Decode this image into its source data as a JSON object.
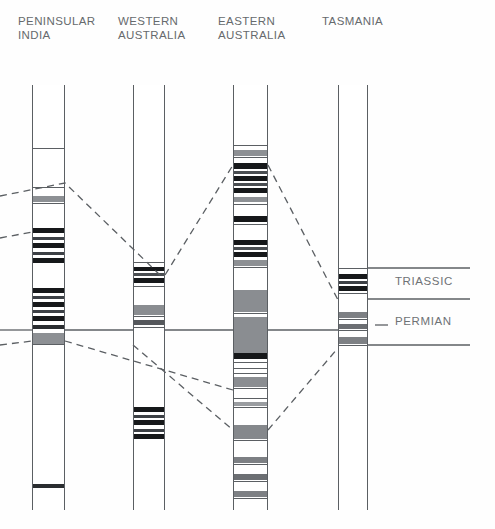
{
  "figure": {
    "type": "stratigraphic-correlation-chart",
    "width": 495,
    "height": 529,
    "background": "#fefefe"
  },
  "columns": [
    {
      "id": "peninsular-india",
      "title": "PENINSULAR\nINDIA",
      "title_x": 18,
      "title_y": 14,
      "x": 32,
      "width": 33,
      "top": 85,
      "bottom": 510,
      "bands": [
        {
          "y": 148,
          "h": 1.4,
          "color": "#5b5f63"
        },
        {
          "y": 187,
          "h": 1.4,
          "color": "#5b5f63"
        },
        {
          "y": 196,
          "h": 6,
          "color": "#8d9094"
        },
        {
          "y": 203,
          "h": 1.4,
          "color": "#5b5f63"
        },
        {
          "y": 228,
          "h": 5,
          "color": "#16181a"
        },
        {
          "y": 237,
          "h": 2.5,
          "color": "#3c4045"
        },
        {
          "y": 243,
          "h": 5,
          "color": "#16181a"
        },
        {
          "y": 252,
          "h": 2.5,
          "color": "#3c4045"
        },
        {
          "y": 258,
          "h": 5,
          "color": "#16181a"
        },
        {
          "y": 288,
          "h": 5,
          "color": "#16181a"
        },
        {
          "y": 296,
          "h": 3,
          "color": "#3c4045"
        },
        {
          "y": 302,
          "h": 5,
          "color": "#16181a"
        },
        {
          "y": 310,
          "h": 3,
          "color": "#3c4045"
        },
        {
          "y": 316,
          "h": 5,
          "color": "#16181a"
        },
        {
          "y": 325,
          "h": 4,
          "color": "#2a2d30"
        },
        {
          "y": 333,
          "h": 11,
          "color": "#8d9094"
        },
        {
          "y": 344,
          "h": 1.4,
          "color": "#5b5f63"
        },
        {
          "y": 484,
          "h": 4,
          "color": "#2a2d30"
        }
      ]
    },
    {
      "id": "western-australia",
      "title": "WESTERN\nAUSTRALIA",
      "title_x": 118,
      "title_y": 14,
      "x": 133,
      "width": 32,
      "top": 85,
      "bottom": 510,
      "bands": [
        {
          "y": 262,
          "h": 1.4,
          "color": "#5b5f63"
        },
        {
          "y": 267,
          "h": 4,
          "color": "#16181a"
        },
        {
          "y": 273,
          "h": 3,
          "color": "#4a4e52"
        },
        {
          "y": 278,
          "h": 5,
          "color": "#16181a"
        },
        {
          "y": 286,
          "h": 1.4,
          "color": "#5b5f63"
        },
        {
          "y": 305,
          "h": 10,
          "color": "#8a8d91"
        },
        {
          "y": 316,
          "h": 1.4,
          "color": "#5b5f63"
        },
        {
          "y": 320,
          "h": 5,
          "color": "#55585c"
        },
        {
          "y": 327,
          "h": 1.4,
          "color": "#5b5f63"
        },
        {
          "y": 407,
          "h": 5,
          "color": "#16181a"
        },
        {
          "y": 415,
          "h": 2.5,
          "color": "#3c4045"
        },
        {
          "y": 420,
          "h": 5,
          "color": "#16181a"
        },
        {
          "y": 429,
          "h": 2.5,
          "color": "#3c4045"
        },
        {
          "y": 434,
          "h": 5,
          "color": "#16181a"
        }
      ]
    },
    {
      "id": "eastern-australia",
      "title": "EASTERN\nAUSTRALIA",
      "title_x": 218,
      "title_y": 14,
      "x": 233,
      "width": 35,
      "top": 85,
      "bottom": 510,
      "bands": [
        {
          "y": 145,
          "h": 1.4,
          "color": "#5b5f63"
        },
        {
          "y": 150,
          "h": 6,
          "color": "#8d9094"
        },
        {
          "y": 157,
          "h": 1.4,
          "color": "#5b5f63"
        },
        {
          "y": 163,
          "h": 6,
          "color": "#16181a"
        },
        {
          "y": 171,
          "h": 3,
          "color": "#4a4e52"
        },
        {
          "y": 176,
          "h": 5,
          "color": "#16181a"
        },
        {
          "y": 183,
          "h": 3,
          "color": "#4a4e52"
        },
        {
          "y": 188,
          "h": 5,
          "color": "#16181a"
        },
        {
          "y": 197,
          "h": 5,
          "color": "#8d9094"
        },
        {
          "y": 204,
          "h": 1.4,
          "color": "#5b5f63"
        },
        {
          "y": 216,
          "h": 6,
          "color": "#16181a"
        },
        {
          "y": 224,
          "h": 1.4,
          "color": "#5b5f63"
        },
        {
          "y": 240,
          "h": 5,
          "color": "#16181a"
        },
        {
          "y": 247,
          "h": 3,
          "color": "#4a4e52"
        },
        {
          "y": 252,
          "h": 5,
          "color": "#16181a"
        },
        {
          "y": 260,
          "h": 6,
          "color": "#8d9094"
        },
        {
          "y": 267,
          "h": 1.4,
          "color": "#5b5f63"
        },
        {
          "y": 290,
          "h": 22,
          "color": "#8a8d91"
        },
        {
          "y": 313,
          "h": 1.4,
          "color": "#5b5f63"
        },
        {
          "y": 317,
          "h": 36,
          "color": "#8a8d91"
        },
        {
          "y": 353,
          "h": 6,
          "color": "#16181a"
        },
        {
          "y": 362,
          "h": 1.4,
          "color": "#5b5f63"
        },
        {
          "y": 368,
          "h": 1.4,
          "color": "#5b5f63"
        },
        {
          "y": 373,
          "h": 1.4,
          "color": "#5b5f63"
        },
        {
          "y": 377,
          "h": 10,
          "color": "#8a8d91"
        },
        {
          "y": 388,
          "h": 1.4,
          "color": "#5b5f63"
        },
        {
          "y": 398,
          "h": 1.4,
          "color": "#5b5f63"
        },
        {
          "y": 402,
          "h": 4,
          "color": "#9a9da1"
        },
        {
          "y": 407,
          "h": 1.4,
          "color": "#5b5f63"
        },
        {
          "y": 425,
          "h": 14,
          "color": "#85888c"
        },
        {
          "y": 440,
          "h": 1.4,
          "color": "#5b5f63"
        },
        {
          "y": 457,
          "h": 6,
          "color": "#7d8084"
        },
        {
          "y": 464,
          "h": 1.4,
          "color": "#5b5f63"
        },
        {
          "y": 474,
          "h": 6,
          "color": "#6c6f73"
        },
        {
          "y": 481,
          "h": 1.4,
          "color": "#5b5f63"
        },
        {
          "y": 491,
          "h": 6,
          "color": "#7d8084"
        },
        {
          "y": 498,
          "h": 1.4,
          "color": "#5b5f63"
        }
      ]
    },
    {
      "id": "tasmania",
      "title": "TASMANIA",
      "title_x": 322,
      "title_y": 14,
      "x": 338,
      "width": 30,
      "top": 85,
      "bottom": 510,
      "bands": [
        {
          "y": 268,
          "h": 1.4,
          "color": "#5b5f63"
        },
        {
          "y": 274,
          "h": 5,
          "color": "#16181a"
        },
        {
          "y": 281,
          "h": 2.5,
          "color": "#3c4045"
        },
        {
          "y": 286,
          "h": 5,
          "color": "#16181a"
        },
        {
          "y": 293,
          "h": 1.4,
          "color": "#5b5f63"
        },
        {
          "y": 312,
          "h": 6,
          "color": "#7d8084"
        },
        {
          "y": 319,
          "h": 1.4,
          "color": "#5b5f63"
        },
        {
          "y": 324,
          "h": 5,
          "color": "#6c6f73"
        },
        {
          "y": 330,
          "h": 1.4,
          "color": "#5b5f63"
        },
        {
          "y": 337,
          "h": 7,
          "color": "#7d8084"
        },
        {
          "y": 345,
          "h": 1.4,
          "color": "#5b5f63"
        }
      ]
    }
  ],
  "era_labels": [
    {
      "text": "TRIASSIC",
      "x": 395,
      "y": 275
    },
    {
      "text": "PERMIAN",
      "x": 395,
      "y": 315
    }
  ],
  "boundary_lines": [
    {
      "name": "triassic-top",
      "x1": 368,
      "y1": 268,
      "x2": 470,
      "y2": 268
    },
    {
      "name": "triassic-base",
      "x1": 368,
      "y1": 299,
      "x2": 470,
      "y2": 299
    },
    {
      "name": "permian-tick",
      "x1": 375,
      "y1": 325,
      "x2": 388,
      "y2": 325
    },
    {
      "name": "permian-base",
      "x1": 368,
      "y1": 345,
      "x2": 470,
      "y2": 345
    }
  ],
  "correlation_lines": [
    {
      "name": "upper-left-dashed",
      "dashed": true,
      "points": "0,196 65,183 160,275"
    },
    {
      "name": "upper-mid-dashed",
      "dashed": true,
      "points": "0,238 32,232"
    },
    {
      "name": "upper-right-dashed",
      "dashed": true,
      "points": "165,275 233,165"
    },
    {
      "name": "east-to-tasmania-dashed",
      "dashed": true,
      "points": "268,165 338,300"
    },
    {
      "name": "solid-datum-india-west",
      "dashed": false,
      "points": "0,330 32,330"
    },
    {
      "name": "solid-datum-1",
      "dashed": false,
      "points": "65,330 133,330"
    },
    {
      "name": "solid-datum-2",
      "dashed": false,
      "points": "165,330 233,330"
    },
    {
      "name": "solid-datum-3",
      "dashed": false,
      "points": "268,330 338,330"
    },
    {
      "name": "lower-dashed-left",
      "dashed": true,
      "points": "0,345 32,341"
    },
    {
      "name": "lower-dashed-v-left",
      "dashed": true,
      "points": "65,341 233,390"
    },
    {
      "name": "lower-dashed-v-down",
      "dashed": true,
      "points": "133,345 233,430"
    },
    {
      "name": "lower-dashed-v-right",
      "dashed": true,
      "points": "268,430 338,348"
    }
  ],
  "colors": {
    "stroke": "#5b5f63",
    "dark_band": "#16181a",
    "mid_band": "#8a8d91",
    "text": "#666a6d",
    "background": "#fefefe"
  }
}
